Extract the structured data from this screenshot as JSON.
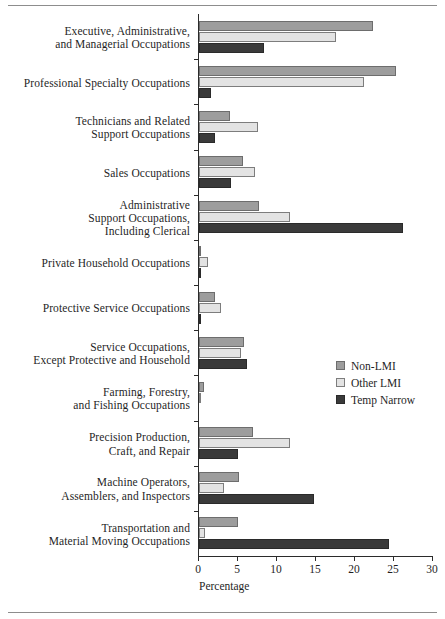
{
  "figure": {
    "has_top_rule": true,
    "has_bottom_rule": true
  },
  "chart_data": {
    "type": "bar",
    "orientation": "horizontal",
    "title": "",
    "xlabel": "Percentage",
    "ylabel": "",
    "xlim": [
      0,
      30
    ],
    "xticks": [
      0,
      5,
      10,
      15,
      20,
      25,
      30
    ],
    "grid": false,
    "legend_position": "middle-right",
    "categories": [
      "Executive, Administrative, and Managerial Occupations",
      "Professional Specialty Occupations",
      "Technicians and Related Support Occupations",
      "Sales Occupations",
      "Administrative Support Occupations, Including Clerical",
      "Private Household Occupations",
      "Protective Service Occupations",
      "Service Occupations, Except Protective and Household",
      "Farming, Forestry, and Fishing Occupations",
      "Precision Production, Craft, and Repair",
      "Machine Operators, Assemblers, and Inspectors",
      "Transportation and Material Moving Occupations"
    ],
    "category_lines": [
      [
        "Executive, Administrative,",
        "and Managerial Occupations"
      ],
      [
        "Professional Specialty Occupations"
      ],
      [
        "Technicians and Related",
        "Support Occupations"
      ],
      [
        "Sales Occupations"
      ],
      [
        "Administrative",
        "Support Occupations,",
        "Including Clerical"
      ],
      [
        "Private Household Occupations"
      ],
      [
        "Protective Service Occupations"
      ],
      [
        "Service Occupations,",
        "Except Protective and Household"
      ],
      [
        "Farming, Forestry,",
        "and Fishing Occupations"
      ],
      [
        "Precision Production,",
        "Craft, and Repair"
      ],
      [
        "Machine Operators,",
        "Assemblers, and Inspectors"
      ],
      [
        "Transportation and",
        "Material Moving Occupations"
      ]
    ],
    "series": [
      {
        "name": "Non-LMI",
        "color": "#9d9d9d",
        "values": [
          22.3,
          25.3,
          4.0,
          5.6,
          7.7,
          0.3,
          2.0,
          5.8,
          0.6,
          6.9,
          5.1,
          5.0
        ]
      },
      {
        "name": "Other LMI",
        "color": "#e3e3e3",
        "values": [
          17.6,
          21.2,
          7.6,
          7.2,
          11.7,
          1.2,
          2.8,
          5.4,
          0.2,
          11.7,
          3.2,
          0.8
        ]
      },
      {
        "name": "Temp Narrow",
        "color": "#3a3a3a",
        "values": [
          8.3,
          1.5,
          2.1,
          4.1,
          26.2,
          0.1,
          0.2,
          6.2,
          0.0,
          5.0,
          14.8,
          24.3
        ]
      }
    ]
  }
}
